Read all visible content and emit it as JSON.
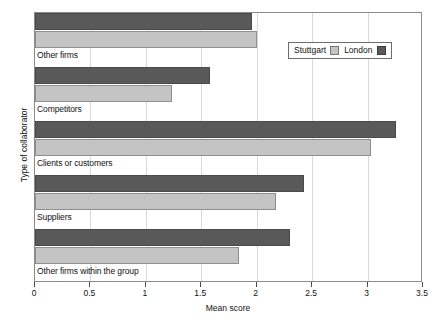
{
  "chart_data": {
    "type": "bar",
    "orientation": "horizontal",
    "title": "",
    "xlabel": "Mean score",
    "ylabel": "Type of collaborator",
    "xlim": [
      0,
      3.5
    ],
    "xticks": [
      "0",
      "0.5",
      "1",
      "1.5",
      "2",
      "2.5",
      "3",
      "3.5"
    ],
    "xtick_values": [
      0,
      0.5,
      1,
      1.5,
      2,
      2.5,
      3,
      3.5
    ],
    "grid": true,
    "legend_position": "top-right",
    "categories": [
      "Other firms",
      "Competitors",
      "Clients or customers",
      "Suppliers",
      "Other firms within the group"
    ],
    "series": [
      {
        "name": "Stuttgart",
        "color": "#c4c4c4",
        "values": [
          2.0,
          1.24,
          3.03,
          2.17,
          1.84
        ]
      },
      {
        "name": "London",
        "color": "#595959",
        "values": [
          1.96,
          1.58,
          3.26,
          2.43,
          2.3
        ]
      }
    ]
  },
  "legend": {
    "items": [
      {
        "label": "Stuttgart",
        "swatch": "stuttgart-swatch"
      },
      {
        "label": "London",
        "swatch": "london-swatch"
      }
    ]
  }
}
